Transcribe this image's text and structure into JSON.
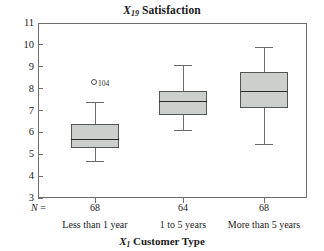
{
  "chart_data": {
    "type": "box",
    "title": "X19 Satisfaction",
    "title_parts": {
      "var": "X",
      "sub": "19",
      "rest": " Satisfaction"
    },
    "xlabel": "X1 Customer Type",
    "xlabel_parts": {
      "var": "X",
      "sub": "1",
      "rest": " Customer Type"
    },
    "ylabel": "",
    "ylim": [
      3,
      11
    ],
    "yticks": [
      11,
      10,
      9,
      8,
      7,
      6,
      5,
      4,
      3
    ],
    "ytick_labels": [
      "11",
      "10",
      "9",
      "8",
      "7",
      "6",
      "5",
      "4",
      "3"
    ],
    "grid": false,
    "legend": "none",
    "n_row_label": "N =",
    "categories": [
      "Less than 1 year",
      "1 to 5 years",
      "More than 5 years"
    ],
    "counts": [
      68,
      64,
      68
    ],
    "count_labels": [
      "68",
      "64",
      "68"
    ],
    "boxes": [
      {
        "category": "Less than 1 year",
        "n": 68,
        "whisker_low": 4.7,
        "q1": 5.3,
        "median": 5.65,
        "q3": 6.4,
        "whisker_high": 7.4,
        "outliers": [
          {
            "value": 8.3,
            "label": "104"
          }
        ]
      },
      {
        "category": "1 to 5 years",
        "n": 64,
        "whisker_low": 6.1,
        "q1": 6.8,
        "median": 7.4,
        "q3": 7.9,
        "whisker_high": 9.1,
        "outliers": []
      },
      {
        "category": "More than 5 years",
        "n": 68,
        "whisker_low": 5.45,
        "q1": 7.1,
        "median": 7.85,
        "q3": 8.75,
        "whisker_high": 9.9,
        "outliers": []
      }
    ],
    "colors": {
      "box_fill": "#ccd0cc",
      "box_border": "#555555",
      "median_line": "#2b2b2b",
      "whisker": "#6b6b6b",
      "axis": "#6e6e6e",
      "text": "#1a1a1a",
      "background": "#ffffff"
    }
  }
}
